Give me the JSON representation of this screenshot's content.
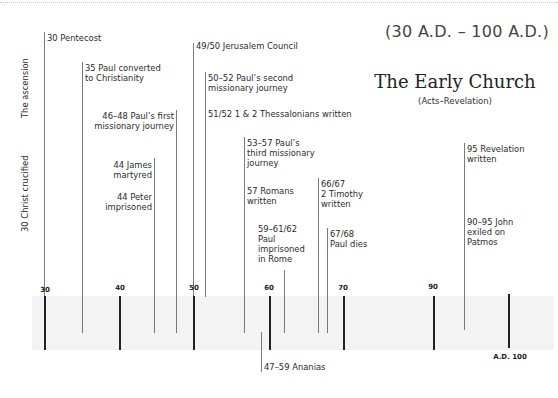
{
  "header": {
    "range": "(30 A.D. – 100 A.D.)",
    "title": "The Early Church",
    "subtitle": "(Acts–Revelation)"
  },
  "side_labels": {
    "ascension": "The ascension",
    "crucified": "30 Christ crucified"
  },
  "axis": {
    "ticks": [
      "30",
      "40",
      "50",
      "60",
      "70",
      "90"
    ],
    "end_label": "A.D. 100"
  },
  "events": {
    "pentecost": "30 Pentecost",
    "paul_converted_1": "35 Paul converted",
    "paul_converted_2": "to Christianity",
    "first_journey_1": "46–48 Paul’s first",
    "first_journey_2": "missionary journey",
    "james_1": "44 James",
    "james_2": "martyred",
    "peter_1": "44 Peter",
    "peter_2": "imprisoned",
    "council": "49/50 Jerusalem Council",
    "second_journey_1": "50–52 Paul’s second",
    "second_journey_2": "missionary journey",
    "thessalonians": "51/52 1 & 2 Thessalonians written",
    "third_journey_1": "53–57 Paul’s",
    "third_journey_2": "third missionary",
    "third_journey_3": "journey",
    "romans_1": "57 Romans",
    "romans_2": "written",
    "imprisoned_1": "59–61/62",
    "imprisoned_2": "Paul",
    "imprisoned_3": "imprisoned",
    "imprisoned_4": "in Rome",
    "timothy_1": "66/67",
    "timothy_2": "2 Timothy",
    "timothy_3": "written",
    "paul_dies_1": "67/68",
    "paul_dies_2": "Paul dies",
    "revelation_1": "95 Revelation",
    "revelation_2": "written",
    "john_1": "90–95 John",
    "john_2": "exiled on",
    "john_3": "Patmos",
    "ananias": "47–59 Ananias"
  }
}
